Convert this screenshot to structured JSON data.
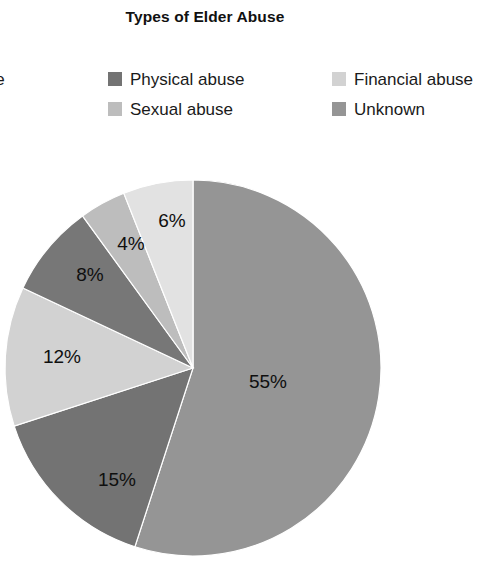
{
  "chart": {
    "title": "Types of Elder Abuse"
  },
  "legend": {
    "columns": [
      {
        "items": [
          {
            "label": "l abuse",
            "color": "#9e9e9e",
            "swatch_visible": false
          },
          {
            "label": "es",
            "color": "#bdbdbd",
            "swatch_visible": false
          }
        ]
      },
      {
        "items": [
          {
            "label": "Physical abuse",
            "color": "#737373",
            "swatch_visible": true
          },
          {
            "label": "Sexual abuse",
            "color": "#bdbdbd",
            "swatch_visible": true
          }
        ]
      },
      {
        "items": [
          {
            "label": "Financial abuse",
            "color": "#d2d2d2",
            "swatch_visible": true
          },
          {
            "label": "Unknown",
            "color": "#959595",
            "swatch_visible": true
          }
        ]
      }
    ]
  },
  "chart_data": {
    "type": "pie",
    "title": "Types of Elder Abuse",
    "xlabel": "",
    "ylabel": "",
    "legend_position": "top",
    "grid": false,
    "start_angle_deg": 0,
    "direction": "clockwise",
    "center": {
      "x": 193,
      "y": 368
    },
    "radius": 188,
    "labels": [
      "55%",
      "15%",
      "12%",
      "8%",
      "4%",
      "6%"
    ],
    "values": [
      55,
      15,
      12,
      8,
      4,
      6
    ],
    "categories": [
      "Emotional abuse",
      "Physical abuse",
      "Financial abuse",
      "Sexual abuse",
      "Unknown",
      "Multiple types"
    ],
    "colors": [
      "#959595",
      "#737373",
      "#d2d2d2",
      "#777777",
      "#bdbdbd",
      "#e2e2e2"
    ],
    "slices": [
      {
        "label": "55%",
        "value": 55,
        "color": "#959595",
        "label_x": 268,
        "label_y": 383
      },
      {
        "label": "15%",
        "value": 15,
        "color": "#737373",
        "label_x": 117,
        "label_y": 481
      },
      {
        "label": "12%",
        "value": 12,
        "color": "#d2d2d2",
        "label_x": 62,
        "label_y": 358
      },
      {
        "label": "8%",
        "value": 8,
        "color": "#777777",
        "label_x": 90,
        "label_y": 276
      },
      {
        "label": "4%",
        "value": 4,
        "color": "#bdbdbd",
        "label_x": 131,
        "label_y": 245
      },
      {
        "label": "6%",
        "value": 6,
        "color": "#e2e2e2",
        "label_x": 172,
        "label_y": 222
      }
    ]
  }
}
